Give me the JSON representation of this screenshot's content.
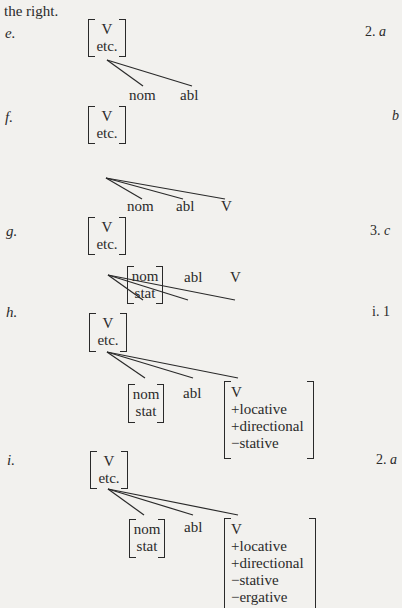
{
  "intro_text": "the right.",
  "examples": [
    {
      "label": "e.",
      "ref": "2.",
      "ref_letter": "a",
      "root": [
        "V",
        "etc."
      ],
      "children": [
        "nom",
        "abl"
      ]
    },
    {
      "label": "f.",
      "ref": "",
      "ref_letter": "b",
      "root": [
        "V",
        "etc."
      ],
      "children": [
        "nom",
        "abl",
        "V"
      ]
    },
    {
      "label": "g.",
      "ref": "3.",
      "ref_letter": "c",
      "root": [
        "V",
        "etc."
      ],
      "children": [
        [
          "nom",
          "stat"
        ],
        "abl",
        "V"
      ]
    },
    {
      "label": "h.",
      "ref": "i.",
      "ref_letter": "1",
      "root": [
        "V",
        "etc."
      ],
      "children": [
        [
          "nom",
          "stat"
        ],
        "abl",
        [
          "V",
          "+locative",
          "+directional",
          "−stative"
        ]
      ]
    },
    {
      "label": "i.",
      "ref": "2.",
      "ref_letter": "a",
      "root": [
        "V",
        "etc."
      ],
      "children": [
        [
          "nom",
          "stat"
        ],
        "abl",
        [
          "V",
          "+locative",
          "+directional",
          "−stative",
          "−ergative"
        ]
      ]
    }
  ]
}
